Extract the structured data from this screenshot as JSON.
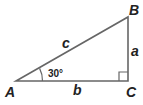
{
  "diagram": {
    "type": "right-triangle",
    "vertices": {
      "A": "A",
      "B": "B",
      "C": "C"
    },
    "sides": {
      "c": "c",
      "a": "a",
      "b": "b"
    },
    "angle_A": "30°",
    "right_angle_at": "C",
    "stroke_color": "#666666",
    "text_color": "#222222"
  }
}
